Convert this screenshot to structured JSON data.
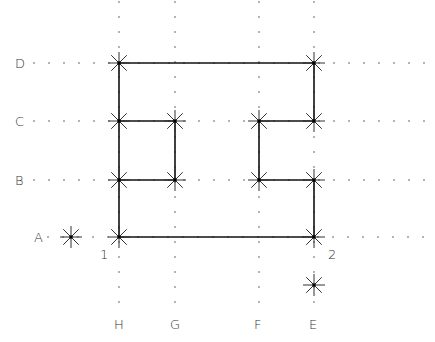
{
  "diagram": {
    "colors": {
      "line": "#111111",
      "dot": "#555555",
      "marker": "#333333",
      "text": "#333333",
      "background": "#ffffff"
    },
    "rows": [
      {
        "id": "D",
        "label": "D",
        "y": 63
      },
      {
        "id": "C",
        "label": "C",
        "y": 121
      },
      {
        "id": "B",
        "label": "B",
        "y": 180
      },
      {
        "id": "A",
        "label": "A",
        "y": 237
      }
    ],
    "columns": [
      {
        "id": "H",
        "label": "H",
        "x": 119
      },
      {
        "id": "G",
        "label": "G",
        "x": 175
      },
      {
        "id": "F",
        "label": "F",
        "x": 259
      },
      {
        "id": "E",
        "label": "E",
        "x": 314
      }
    ],
    "point_labels": [
      {
        "id": "1",
        "label": "1",
        "x": 103,
        "y": 252
      },
      {
        "id": "2",
        "label": "2",
        "x": 330,
        "y": 252
      }
    ],
    "markers": [
      {
        "x": 119,
        "y": 63
      },
      {
        "x": 314,
        "y": 63
      },
      {
        "x": 119,
        "y": 121
      },
      {
        "x": 175,
        "y": 121
      },
      {
        "x": 259,
        "y": 121
      },
      {
        "x": 314,
        "y": 121
      },
      {
        "x": 119,
        "y": 180
      },
      {
        "x": 175,
        "y": 180
      },
      {
        "x": 259,
        "y": 180
      },
      {
        "x": 314,
        "y": 180
      },
      {
        "x": 119,
        "y": 237
      },
      {
        "x": 314,
        "y": 237
      },
      {
        "x": 71,
        "y": 237
      },
      {
        "x": 314,
        "y": 285
      }
    ],
    "segments": [
      [
        119,
        63,
        314,
        63
      ],
      [
        119,
        63,
        119,
        237
      ],
      [
        314,
        63,
        314,
        121
      ],
      [
        119,
        121,
        175,
        121
      ],
      [
        175,
        121,
        175,
        180
      ],
      [
        119,
        180,
        175,
        180
      ],
      [
        259,
        121,
        314,
        121
      ],
      [
        259,
        121,
        259,
        180
      ],
      [
        259,
        180,
        314,
        180
      ],
      [
        314,
        180,
        314,
        237
      ],
      [
        119,
        237,
        314,
        237
      ]
    ]
  }
}
